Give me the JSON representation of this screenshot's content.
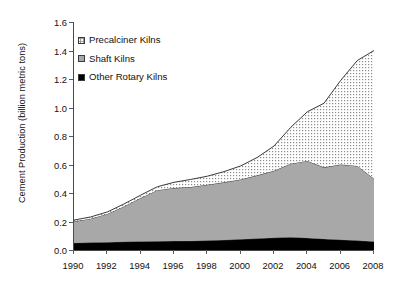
{
  "chart_data": {
    "type": "area",
    "stacked": true,
    "title": "",
    "xlabel": "",
    "ylabel": "Cement Production (billion metric tons)",
    "xlim": [
      1990,
      2008
    ],
    "ylim": [
      0.0,
      1.6
    ],
    "ytick_labels": [
      "0.0",
      "0.2",
      "0.4",
      "0.6",
      "0.8",
      "1.0",
      "1.2",
      "1.4",
      "1.6"
    ],
    "ytick_values": [
      0.0,
      0.2,
      0.4,
      0.6,
      0.8,
      1.0,
      1.2,
      1.4,
      1.6
    ],
    "xtick_labels": [
      "1990",
      "1992",
      "1994",
      "1996",
      "1998",
      "2000",
      "2002",
      "2004",
      "2006",
      "2008"
    ],
    "xtick_values": [
      1990,
      1992,
      1994,
      1996,
      1998,
      2000,
      2002,
      2004,
      2006,
      2008
    ],
    "grid": false,
    "legend_position": "upper-left",
    "x": [
      1990,
      1991,
      1992,
      1993,
      1994,
      1995,
      1996,
      1997,
      1998,
      1999,
      2000,
      2001,
      2002,
      2003,
      2004,
      2005,
      2006,
      2007,
      2008
    ],
    "series": [
      {
        "name": "Other Rotary Kilns",
        "color": "#000000",
        "values": [
          0.05,
          0.052,
          0.055,
          0.058,
          0.06,
          0.062,
          0.063,
          0.064,
          0.066,
          0.07,
          0.075,
          0.08,
          0.086,
          0.09,
          0.085,
          0.078,
          0.072,
          0.066,
          0.06
        ]
      },
      {
        "name": "Shaft Kilns",
        "color": "#a8a8a8",
        "values": [
          0.15,
          0.168,
          0.198,
          0.248,
          0.305,
          0.358,
          0.372,
          0.378,
          0.392,
          0.405,
          0.42,
          0.444,
          0.47,
          0.516,
          0.54,
          0.502,
          0.528,
          0.524,
          0.44
        ]
      },
      {
        "name": "Precalciner Kilns",
        "color": "#ffffff",
        "pattern": "dotted",
        "values": [
          0.01,
          0.012,
          0.014,
          0.017,
          0.02,
          0.024,
          0.04,
          0.053,
          0.06,
          0.075,
          0.095,
          0.126,
          0.174,
          0.254,
          0.345,
          0.45,
          0.59,
          0.74,
          0.9
        ]
      }
    ],
    "totals": [
      0.21,
      0.232,
      0.267,
      0.323,
      0.385,
      0.444,
      0.475,
      0.495,
      0.518,
      0.55,
      0.59,
      0.65,
      0.73,
      0.86,
      0.97,
      1.03,
      1.19,
      1.33,
      1.4
    ]
  },
  "legend": {
    "items": [
      {
        "label": "Precalciner Kilns",
        "swatch": "precalciner-swatch"
      },
      {
        "label": "Shaft Kilns",
        "swatch": "shaft-swatch"
      },
      {
        "label": "Other Rotary Kilns",
        "swatch": "other-rotary-swatch"
      }
    ]
  }
}
